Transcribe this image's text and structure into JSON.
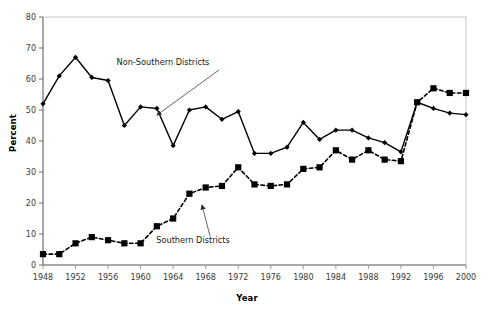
{
  "chart_data": {
    "type": "line",
    "title": "",
    "xlabel": "Year",
    "ylabel": "Percent",
    "xlim": [
      1948,
      2000
    ],
    "ylim": [
      0,
      80
    ],
    "ytick_step": 10,
    "xtick_step": 4,
    "grid": false,
    "legend_position": "annotations-inline",
    "yticks": [
      "0",
      "10",
      "20",
      "30",
      "40",
      "50",
      "60",
      "70",
      "80"
    ],
    "xticks": [
      "1948",
      "1952",
      "1956",
      "1960",
      "1964",
      "1968",
      "1972",
      "1976",
      "1980",
      "1984",
      "1988",
      "1992",
      "1996",
      "2000"
    ],
    "x": [
      1948,
      1950,
      1952,
      1954,
      1956,
      1958,
      1960,
      1962,
      1964,
      1966,
      1968,
      1970,
      1972,
      1974,
      1976,
      1978,
      1980,
      1982,
      1984,
      1986,
      1988,
      1990,
      1992,
      1994,
      1996,
      1998,
      2000
    ],
    "series": [
      {
        "name": "Non-Southern Districts",
        "marker": "diamond",
        "line_style": "solid",
        "color": "#000000",
        "values": [
          52,
          61,
          67,
          60.5,
          59.5,
          45,
          51,
          50.5,
          38.5,
          50,
          51,
          47,
          49.5,
          36,
          36,
          38,
          46,
          40.5,
          43.5,
          43.5,
          41,
          39.5,
          36.5,
          52.5,
          50.5,
          49,
          48.5
        ]
      },
      {
        "name": "Southern Districts",
        "marker": "square",
        "line_style": "dashed",
        "color": "#000000",
        "values": [
          3.5,
          3.5,
          7,
          9,
          8,
          7,
          7,
          12.5,
          15,
          23,
          25,
          25.5,
          31.5,
          26,
          25.5,
          26,
          31,
          31.5,
          37,
          34,
          37,
          34,
          33.5,
          52.5,
          57,
          55.5,
          55.5
        ]
      }
    ],
    "annotations": [
      {
        "text": "Non-Southern Districts",
        "label_x": 163,
        "label_y": 65,
        "arrow_from_x": 219,
        "arrow_from_y": 70,
        "arrow_to_x": 157,
        "arrow_to_y": 115
      },
      {
        "text": "Southern Districts",
        "label_x": 193,
        "label_y": 243,
        "arrow_from_x": 210,
        "arrow_from_y": 236,
        "arrow_to_x": 202,
        "arrow_to_y": 205
      }
    ]
  }
}
